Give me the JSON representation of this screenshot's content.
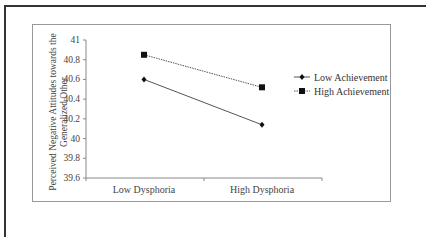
{
  "chart_data": {
    "type": "line",
    "title": "",
    "xlabel": "",
    "ylabel": "Perceived Negative Attitudes towards the Generalized Other",
    "ylabel_lines": [
      "Perceived Negative Attitudes towards the",
      "Generalized Other"
    ],
    "categories": [
      "Low Dysphoria",
      "High Dysphoria"
    ],
    "yticks": [
      "41",
      "40.8",
      "40.6",
      "40.4",
      "40.2",
      "40",
      "39.8",
      "39.6"
    ],
    "ylim": [
      39.6,
      41
    ],
    "grid": false,
    "legend_position": "right",
    "series": [
      {
        "name": "Low Achievement",
        "marker": "diamond",
        "line": "solid",
        "values": [
          40.6,
          40.14
        ]
      },
      {
        "name": "High Achievement",
        "marker": "square",
        "line": "dotted",
        "values": [
          40.85,
          40.52
        ]
      }
    ]
  }
}
